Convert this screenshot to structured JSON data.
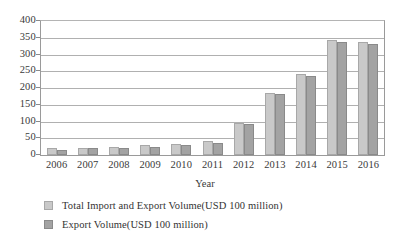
{
  "chart_data": {
    "type": "bar",
    "title": "",
    "xlabel": "Year",
    "ylabel": "",
    "ylim": [
      0,
      400
    ],
    "ytick_step": 50,
    "yticks": [
      "400",
      "350",
      "300",
      "250",
      "200",
      "150",
      "100",
      "50",
      "0"
    ],
    "grid": true,
    "legend_position": "bottom-left",
    "categories": [
      "2006",
      "2007",
      "2008",
      "2009",
      "2010",
      "2011",
      "2012",
      "2013",
      "2014",
      "2015",
      "2016"
    ],
    "series": [
      {
        "name": "Total Import and Export Volume(USD 100 million)",
        "color": "#c9c9c9",
        "values": [
          20,
          21,
          23,
          29,
          34,
          42,
          95,
          185,
          241,
          343,
          337
        ]
      },
      {
        "name": "Export Volume(USD 100 million)",
        "color": "#a3a3a3",
        "values": [
          15,
          20,
          22,
          25,
          31,
          36,
          92,
          181,
          236,
          338,
          332
        ]
      }
    ]
  },
  "legend": {
    "items": [
      {
        "label": "Total Import and Export Volume(USD 100 million)"
      },
      {
        "label": "Export Volume(USD 100 million)"
      }
    ]
  }
}
